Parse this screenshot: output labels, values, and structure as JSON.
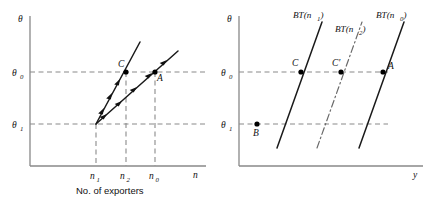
{
  "figure": {
    "background": "#ffffff",
    "line_color": "#1a1a1a",
    "guide_color": "#8a8a8a",
    "axis_color": "#888888"
  },
  "left_panel": {
    "name": "number-of-exporters-diagram",
    "y_axis_label": "θ",
    "x_axis_label": "n",
    "caption": "No. of exporters",
    "y_ticks": [
      {
        "label": "θ",
        "sub": "0",
        "value": 72
      },
      {
        "label": "θ",
        "sub": "1",
        "value": 124
      }
    ],
    "x_ticks": [
      {
        "label": "n",
        "sub": "1",
        "value": 96
      },
      {
        "label": "n",
        "sub": "2",
        "value": 126
      },
      {
        "label": "n",
        "sub": "0",
        "value": 155
      }
    ],
    "points": [
      {
        "label": "C",
        "x": 126,
        "y": 72
      },
      {
        "label": "A",
        "x": 155,
        "y": 72
      }
    ],
    "curves": [
      {
        "name": "steep-adjustment-path",
        "style": "solid",
        "arrows": "down-left"
      },
      {
        "name": "shallow-adjustment-path",
        "style": "solid",
        "arrows": "down-left"
      }
    ]
  },
  "right_panel": {
    "name": "bt-schedule-diagram",
    "y_axis_label": "θ",
    "x_axis_label": "y",
    "y_ticks": [
      {
        "label": "θ",
        "sub": "0",
        "value": 72
      },
      {
        "label": "θ",
        "sub": "1",
        "value": 124
      }
    ],
    "curves": [
      {
        "name": "bt-n1-curve",
        "label": "BT(n",
        "sub": "1",
        "close": ")",
        "style": "solid"
      },
      {
        "name": "bt-n2-curve",
        "label": "BT(n",
        "sub": "2",
        "close": ")",
        "style": "dash-dot"
      },
      {
        "name": "bt-n0-curve",
        "label": "BT(n",
        "sub": "0",
        "close": ")",
        "style": "solid"
      }
    ],
    "points": [
      {
        "label": "C",
        "x": 88,
        "y": 72
      },
      {
        "label": "C′",
        "x": 128,
        "y": 72
      },
      {
        "label": "A",
        "x": 170,
        "y": 72
      },
      {
        "label": "B",
        "x": 44,
        "y": 124
      }
    ]
  }
}
